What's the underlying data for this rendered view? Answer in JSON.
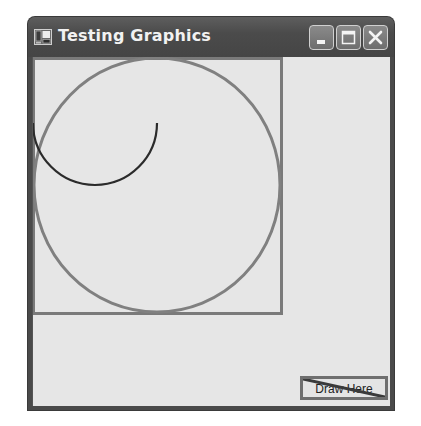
{
  "window": {
    "title": "Testing Graphics",
    "icon": "application-icon",
    "controls": [
      {
        "name": "minimize",
        "icon": "minimize-icon"
      },
      {
        "name": "maximize",
        "icon": "maximize-icon"
      },
      {
        "name": "close",
        "icon": "close-icon"
      }
    ]
  },
  "canvas": {
    "background": "#e6e6e6",
    "shapes": [
      {
        "type": "rectangle",
        "x": 0,
        "y": 0,
        "width": 249,
        "height": 256,
        "stroke": "#7a7a7a",
        "stroke_width": 3
      },
      {
        "type": "ellipse",
        "cx": 125,
        "cy": 128,
        "rx": 124,
        "ry": 127,
        "stroke": "#7e7e7e",
        "stroke_width": 3
      },
      {
        "type": "arc",
        "cx": 63,
        "cy": 65,
        "r": 62,
        "start_angle": 180,
        "sweep": -180,
        "stroke": "#2b2b2b",
        "stroke_width": 2
      }
    ]
  },
  "draw_button": {
    "label": "Draw Here",
    "overlay_line": {
      "stroke": "#3a3a3a",
      "stroke_width": 3
    }
  },
  "colors": {
    "titlebar": "#4b4b4b",
    "frame": "#4a4a4a",
    "client": "#e6e6e6",
    "shape_gray": "#7a7a7a",
    "arc_dark": "#2b2b2b"
  }
}
